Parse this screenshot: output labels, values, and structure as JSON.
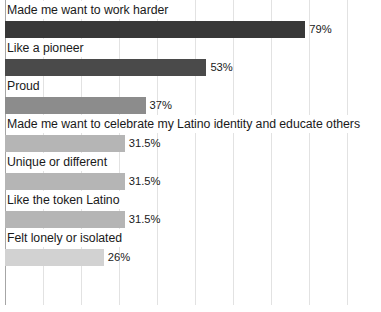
{
  "chart_data": {
    "type": "bar",
    "orientation": "horizontal",
    "title": "",
    "subtitle": "",
    "xlabel": "",
    "ylabel": "",
    "xlim": [
      0,
      100
    ],
    "grid": "vertical",
    "legend": "none",
    "gridline_step": 10,
    "categories": [
      "Made me want to work harder",
      "Like a pioneer",
      "Proud",
      "Made me want to celebrate my Latino identity and educate others",
      "Unique or different",
      "Like the token Latino",
      "Felt lonely or isolated"
    ],
    "values": [
      79,
      53,
      37,
      31.5,
      31.5,
      31.5,
      26
    ],
    "value_labels": [
      "79%",
      "53%",
      "37%",
      "31.5%",
      "31.5%",
      "31.5%",
      "26%"
    ],
    "bar_colors": [
      "#383838",
      "#4a4a4a",
      "#8c8c8c",
      "#b5b5b5",
      "#b5b5b5",
      "#b5b5b5",
      "#d2d2d2"
    ],
    "colors": {
      "background": "#ffffff",
      "gridline": "#e2e2e2",
      "axis": "#a6a6a6",
      "text": "#1a1a1a"
    }
  }
}
